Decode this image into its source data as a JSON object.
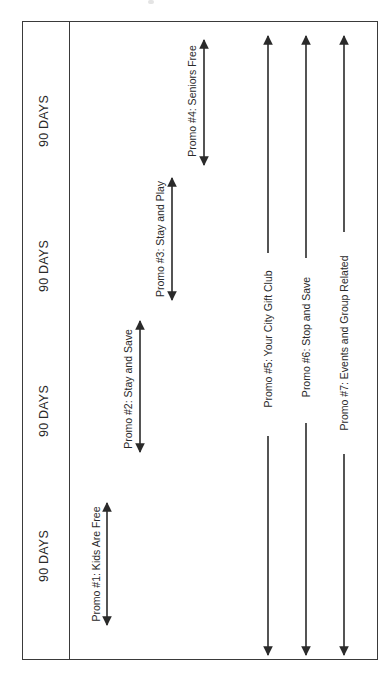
{
  "diagram": {
    "type": "promotion-timeline",
    "orientation": "rotated-90-ccw",
    "colors": {
      "line": "#2a2a2a",
      "frame": "#3a3a3a",
      "background": "#ffffff"
    },
    "periods": [
      {
        "label": "90 DAYS"
      },
      {
        "label": "90 DAYS"
      },
      {
        "label": "90 DAYS"
      },
      {
        "label": "90 DAYS"
      }
    ],
    "promos": [
      {
        "label": "Promo #1: Kids Are Free",
        "period": 1,
        "span": "single-period"
      },
      {
        "label": "Promo #2: Stay and Save",
        "period": 2,
        "span": "single-period"
      },
      {
        "label": "Promo #3: Stay and Play",
        "period": 3,
        "span": "single-period"
      },
      {
        "label": "Promo #4: Seniors Free",
        "period": 4,
        "span": "single-period"
      },
      {
        "label": "Promo #5: Your City Gift Club",
        "period": "1-4",
        "span": "full-year"
      },
      {
        "label": "Promo #6: Stop and Save",
        "period": "1-4",
        "span": "full-year"
      },
      {
        "label": "Promo #7: Events and Group Related",
        "period": "1-4",
        "span": "full-year"
      }
    ]
  }
}
